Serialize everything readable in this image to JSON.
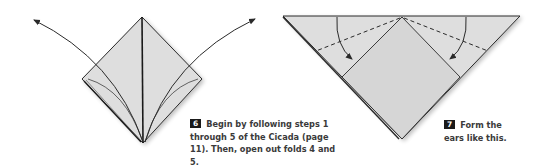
{
  "steps": [
    {
      "number": "6",
      "text": "Begin by following steps 1 through 5 of the Cicada (page 11). Then, open out folds 4 and 5.",
      "lines": [
        "Begin by following steps 1",
        "through 5 of the Cicada (page",
        "11). Then, open out folds 4 and 5."
      ]
    },
    {
      "number": "7",
      "text": "Form the ears like this.",
      "lines": [
        "Form the",
        "ears like this."
      ]
    }
  ],
  "colors": {
    "paper": "#dedede",
    "line": "#2a2a2a",
    "step_badge": "#1a1a1a"
  }
}
